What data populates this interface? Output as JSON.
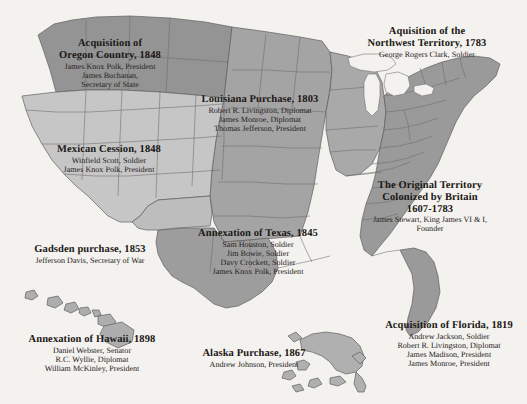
{
  "map": {
    "title_alt": "United States territorial acquisitions map",
    "background_color": "#f4f2ee",
    "region_colors": {
      "original_colonies": "#9a9a9a",
      "northwest_territory": "#a9a9a9",
      "louisiana_purchase": "#a4a4a4",
      "oregon_country": "#949494",
      "mexican_cession": "#c6c6c6",
      "gadsden_purchase": "#bdbdbd",
      "texas_annexation": "#9d9d9d",
      "florida_acquisition": "#9a9a9a",
      "alaska": "#b0b0b0",
      "hawaii": "#aeaeae",
      "lake_fill": "#f4f2ee",
      "border": "#5c5c5c"
    }
  },
  "labels": [
    {
      "id": "oregon",
      "title_lines": [
        "Acquisition of",
        "Oregon Country, 1848"
      ],
      "names": [
        "James Knox Polk, President",
        "James Buchanan,",
        "Secretary of State"
      ]
    },
    {
      "id": "northwest",
      "title_lines": [
        "Aquisition of the",
        "Northwest Territory, 1783"
      ],
      "names": [
        "George Rogers Clark, Soldier"
      ]
    },
    {
      "id": "louisiana",
      "title_lines": [
        "Louisiana Purchase, 1803"
      ],
      "names": [
        "Robert R. Livingston, Diplomat",
        "James Monroe, Diplomat",
        "Thomas Jefferson, President"
      ]
    },
    {
      "id": "mexican",
      "title_lines": [
        "Mexican Cession, 1848"
      ],
      "names": [
        "Winfield Scott, Soldier",
        "James Knox Polk, President"
      ]
    },
    {
      "id": "original",
      "title_lines": [
        "The Original Territory",
        "Colonized by Britain",
        "1607-1783"
      ],
      "names": [
        "James Stewart, King James VI & I,",
        "Founder"
      ]
    },
    {
      "id": "gadsden",
      "title_lines": [
        "Gadsden purchase, 1853"
      ],
      "names": [
        "Jefferson Davis, Secretary of War"
      ]
    },
    {
      "id": "texas",
      "title_lines": [
        "Annexation of Texas, 1845"
      ],
      "names": [
        "Sam Houston, Soldier",
        "Jim Bowie, Soldier",
        "Davy Crockett, Soldier",
        "James Knox Polk, President"
      ]
    },
    {
      "id": "hawaii",
      "title_lines": [
        "Annexation of Hawaii, 1898"
      ],
      "names": [
        "Daniel Webster, Senator",
        "R.C. Wyllie, Diplomat",
        "William McKinley, President"
      ]
    },
    {
      "id": "alaska",
      "title_lines": [
        "Alaska Purchase, 1867"
      ],
      "names": [
        "Andrew Johnson, President"
      ]
    },
    {
      "id": "florida",
      "title_lines": [
        "Acquisition of Florida, 1819"
      ],
      "names": [
        "Andrew Jackson, Soldier",
        "Robert R. Livingston, Diplomat",
        "James Madison, President",
        "James Monroe, President"
      ]
    }
  ]
}
